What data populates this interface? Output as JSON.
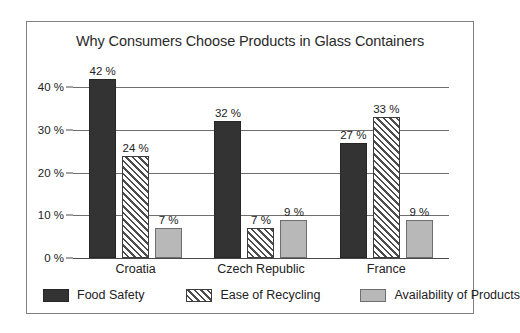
{
  "chart_data": {
    "type": "bar",
    "title": "Why Consumers Choose Products in Glass Containers",
    "xlabel": "",
    "ylabel": "",
    "ylim": [
      0,
      45
    ],
    "grid": true,
    "legend_position": "bottom",
    "categories": [
      "Croatia",
      "Czech Republic",
      "France"
    ],
    "ytick_labels": [
      "0 %",
      "10 %",
      "20 %",
      "30 %",
      "40 %"
    ],
    "ytick_values": [
      0,
      10,
      20,
      30,
      40
    ],
    "series": [
      {
        "name": "Food Safety",
        "style": "solid-dark",
        "color": "#333333",
        "values": [
          42,
          32,
          27
        ],
        "value_labels": [
          "42 %",
          "32 %",
          "27 %"
        ]
      },
      {
        "name": "Ease of Recycling",
        "style": "diagonal-hatch",
        "color": "#ffffff",
        "values": [
          24,
          7,
          33
        ],
        "value_labels": [
          "24 %",
          "7 %",
          "33 %"
        ]
      },
      {
        "name": "Availability of Products",
        "style": "solid-light",
        "color": "#b8b8b8",
        "values": [
          7,
          9,
          9
        ],
        "value_labels": [
          "7 %",
          "9 %",
          "9 %"
        ]
      }
    ]
  }
}
